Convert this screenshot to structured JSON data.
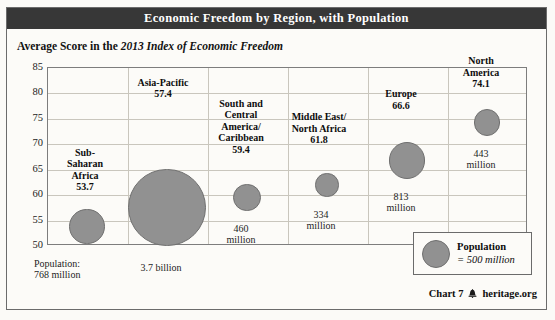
{
  "header": {
    "title": "Economic Freedom by Region, with Population"
  },
  "subtitle": {
    "prefix": "Average Score in the ",
    "italic": "2013 Index of Economic Freedom"
  },
  "legend": {
    "title": "Population",
    "value": "= 500 million",
    "bubble_icon": "population-circle-icon"
  },
  "footer": {
    "chart_number": "Chart 7",
    "bell_icon": "\u0006",
    "source": "heritage.org"
  },
  "chart_data": {
    "type": "scatter",
    "title": "Economic Freedom by Region, with Population",
    "subtitle": "Average Score in the 2013 Index of Economic Freedom",
    "xlabel": "",
    "ylabel": "Average Score",
    "ylim": [
      50,
      85
    ],
    "yticks": [
      50,
      55,
      60,
      65,
      70,
      75,
      80,
      85
    ],
    "ytick_labels": [
      "50",
      "55",
      "60",
      "65",
      "70",
      "75",
      "80",
      "85"
    ],
    "grid": true,
    "legend_position": "bottom-right",
    "size_reference": "bubble area proportional to population; reference bubble = 500 million",
    "categories": [
      "Sub-Saharan Africa",
      "Asia-Pacific",
      "South and Central America/Caribbean",
      "Middle East/North Africa",
      "Europe",
      "North America"
    ],
    "values": [
      53.7,
      57.4,
      59.4,
      61.8,
      66.6,
      74.1
    ],
    "populations": [
      "768 million",
      "3.7 billion",
      "460 million",
      "334 million",
      "813 million",
      "443 million"
    ],
    "population_millions": [
      768,
      3700,
      460,
      334,
      813,
      443
    ],
    "points": [
      {
        "label_lines": [
          "Sub-",
          "Saharan",
          "Africa"
        ],
        "score": "53.7",
        "value": 53.7,
        "population_label_lines": [
          "Population:",
          "768 million"
        ],
        "population": 768
      },
      {
        "label_lines": [
          "Asia-Pacific"
        ],
        "score": "57.4",
        "value": 57.4,
        "population_label_lines": [
          "3.7 billion"
        ],
        "population": 3700
      },
      {
        "label_lines": [
          "South and",
          "Central",
          "America/",
          "Caribbean"
        ],
        "score": "59.4",
        "value": 59.4,
        "population_label_lines": [
          "460",
          "million"
        ],
        "population": 460
      },
      {
        "label_lines": [
          "Middle East/",
          "North Africa"
        ],
        "score": "61.8",
        "value": 61.8,
        "population_label_lines": [
          "334",
          "million"
        ],
        "population": 334
      },
      {
        "label_lines": [
          "Europe"
        ],
        "score": "66.6",
        "value": 66.6,
        "population_label_lines": [
          "813",
          "million"
        ],
        "population": 813
      },
      {
        "label_lines": [
          "North",
          "America"
        ],
        "score": "74.1",
        "value": 74.1,
        "population_label_lines": [
          "443",
          "million"
        ],
        "population": 443
      }
    ]
  },
  "colors": {
    "title_band": "#373737",
    "bubble_fill": "#919191",
    "bubble_stroke": "#6f6f6f",
    "grid": "#c9c6bd",
    "page_bg": "#fcfbf8"
  }
}
